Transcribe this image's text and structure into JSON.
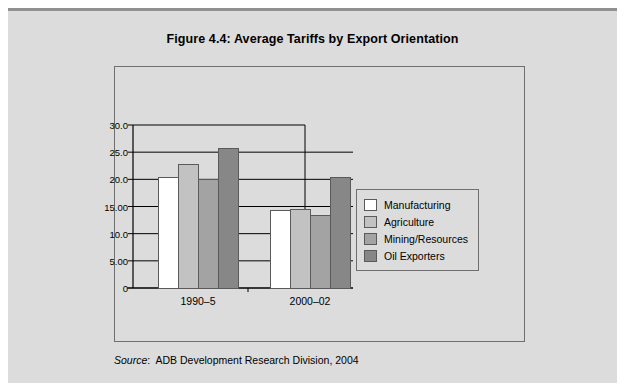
{
  "figure": {
    "title": "Figure 4.4:  Average Tariffs by Export Orientation",
    "source_label": "Source",
    "source_separator": ":",
    "source_text": "ADB Development Research Division, 2004"
  },
  "colors": {
    "panel_background": "#dcdcdc",
    "panel_top_edge": "#909090",
    "frame_border": "#6f6f6f",
    "axis_line": "#000000",
    "gridline": "#000000",
    "bar_outline": "#5a5a5a",
    "manufacturing": "#ffffff",
    "agriculture": "#c2c2c2",
    "mining_resources": "#a3a3a3",
    "oil_exporters": "#878787",
    "text": "#000000"
  },
  "chart_data": {
    "type": "bar",
    "title": "Figure 4.4:  Average Tariffs by Export Orientation",
    "xlabel": "",
    "ylabel": "",
    "categories": [
      "1990–5",
      "2000–02"
    ],
    "series": [
      {
        "name": "Manufacturing",
        "values": [
          20.4,
          14.2
        ]
      },
      {
        "name": "Agriculture",
        "values": [
          22.8,
          14.5
        ]
      },
      {
        "name": "Mining/Resources",
        "values": [
          20.0,
          13.3
        ]
      },
      {
        "name": "Oil Exporters",
        "values": [
          25.7,
          20.4
        ]
      }
    ],
    "ylim": [
      0,
      30
    ],
    "ytick_values": [
      30,
      25,
      20,
      15,
      10,
      5,
      0
    ],
    "ytick_labels": [
      "30.0",
      "25.0",
      "20.0",
      "15.00",
      "10.0",
      "5.00",
      "0"
    ],
    "grid": true,
    "grid_axis": "y",
    "legend_position": "right"
  },
  "legend": {
    "items": [
      {
        "label": "Manufacturing",
        "color": "#ffffff"
      },
      {
        "label": "Agriculture",
        "color": "#c2c2c2"
      },
      {
        "label": "Mining/Resources",
        "color": "#a3a3a3"
      },
      {
        "label": "Oil Exporters",
        "color": "#878787"
      }
    ]
  }
}
